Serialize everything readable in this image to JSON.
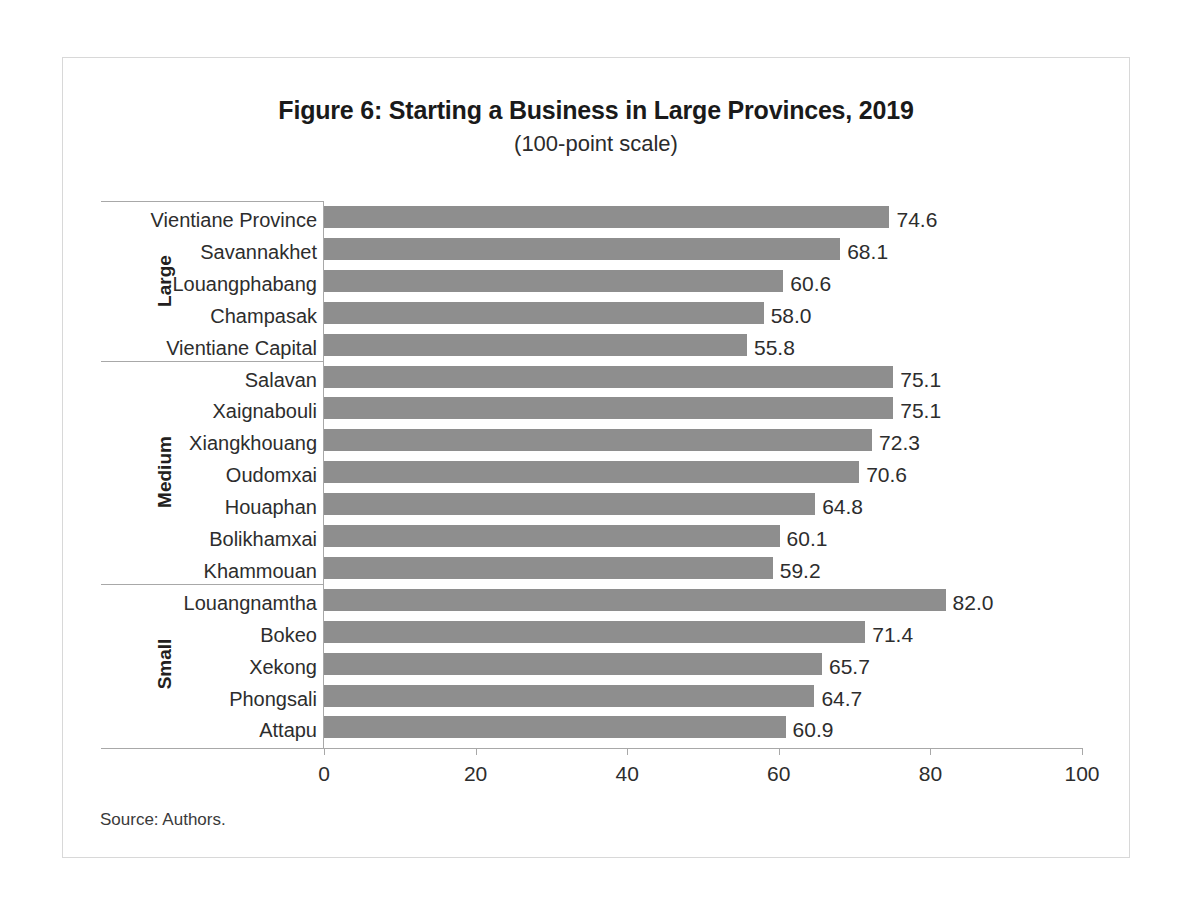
{
  "figure": {
    "title": "Figure 6: Starting a Business in Large Provinces, 2019",
    "subtitle": "(100-point scale)",
    "source": "Source: Authors."
  },
  "chart_data": {
    "type": "bar",
    "orientation": "horizontal",
    "title": "Figure 6: Starting a Business in Large Provinces, 2019",
    "subtitle": "(100-point scale)",
    "xlabel": "",
    "ylabel": "",
    "xlim": [
      0,
      100
    ],
    "xticks": [
      0,
      20,
      40,
      60,
      80,
      100
    ],
    "xtick_labels": [
      "0",
      "20",
      "40",
      "60",
      "80",
      "100"
    ],
    "grid": false,
    "legend": false,
    "bar_color": "#8e8e8e",
    "groups": [
      {
        "name": "Large",
        "categories": [
          "Vientiane Province",
          "Savannakhet",
          "Louangphabang",
          "Champasak",
          "Vientiane Capital"
        ],
        "values": [
          74.6,
          68.1,
          60.6,
          58.0,
          55.8
        ],
        "value_labels": [
          "74.6",
          "68.1",
          "60.6",
          "58.0",
          "55.8"
        ]
      },
      {
        "name": "Medium",
        "categories": [
          "Salavan",
          "Xaignabouli",
          "Xiangkhouang",
          "Oudomxai",
          "Houaphan",
          "Bolikhamxai",
          "Khammouan"
        ],
        "values": [
          75.1,
          75.1,
          72.3,
          70.6,
          64.8,
          60.1,
          59.2
        ],
        "value_labels": [
          "75.1",
          "75.1",
          "72.3",
          "70.6",
          "64.8",
          "60.1",
          "59.2"
        ]
      },
      {
        "name": "Small",
        "categories": [
          "Louangnamtha",
          "Bokeo",
          "Xekong",
          "Phongsali",
          "Attapu"
        ],
        "values": [
          82.0,
          71.4,
          65.7,
          64.7,
          60.9
        ],
        "value_labels": [
          "82.0",
          "71.4",
          "65.7",
          "64.7",
          "60.9"
        ]
      }
    ],
    "categories": [
      "Vientiane Province",
      "Savannakhet",
      "Louangphabang",
      "Champasak",
      "Vientiane Capital",
      "Salavan",
      "Xaignabouli",
      "Xiangkhouang",
      "Oudomxai",
      "Houaphan",
      "Bolikhamxai",
      "Khammouan",
      "Louangnamtha",
      "Bokeo",
      "Xekong",
      "Phongsali",
      "Attapu"
    ],
    "values": [
      74.6,
      68.1,
      60.6,
      58.0,
      55.8,
      75.1,
      75.1,
      72.3,
      70.6,
      64.8,
      60.1,
      59.2,
      82.0,
      71.4,
      65.7,
      64.7,
      60.9
    ]
  }
}
